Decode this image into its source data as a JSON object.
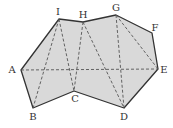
{
  "diagram": {
    "type": "polygon-triangulation",
    "fill_color": "#d9d9d9",
    "edge_color": "#333333",
    "dash_color": "#555555",
    "vertices": [
      {
        "id": "A",
        "x": 21,
        "y": 70,
        "lx": 12,
        "ly": 70
      },
      {
        "id": "B",
        "x": 33,
        "y": 108,
        "lx": 33,
        "ly": 117
      },
      {
        "id": "C",
        "x": 74,
        "y": 91,
        "lx": 75,
        "ly": 99
      },
      {
        "id": "D",
        "x": 124,
        "y": 108,
        "lx": 124,
        "ly": 117
      },
      {
        "id": "E",
        "x": 158,
        "y": 69,
        "lx": 164,
        "ly": 70
      },
      {
        "id": "F",
        "x": 152,
        "y": 33,
        "lx": 155,
        "ly": 28
      },
      {
        "id": "G",
        "x": 116,
        "y": 15,
        "lx": 116,
        "ly": 8
      },
      {
        "id": "H",
        "x": 83,
        "y": 22,
        "lx": 83,
        "ly": 15
      },
      {
        "id": "I",
        "x": 59,
        "y": 19,
        "lx": 58,
        "ly": 12
      }
    ],
    "boundary_order": [
      "A",
      "I",
      "H",
      "G",
      "F",
      "E",
      "D",
      "C",
      "B"
    ],
    "dashed_segments": [
      [
        "A",
        "E"
      ],
      [
        "I",
        "B"
      ],
      [
        "I",
        "C"
      ],
      [
        "H",
        "C"
      ],
      [
        "H",
        "D"
      ],
      [
        "G",
        "D"
      ],
      [
        "G",
        "E"
      ]
    ],
    "labels": {
      "A": "A",
      "B": "B",
      "C": "C",
      "D": "D",
      "E": "E",
      "F": "F",
      "G": "G",
      "H": "H",
      "I": "I"
    }
  }
}
